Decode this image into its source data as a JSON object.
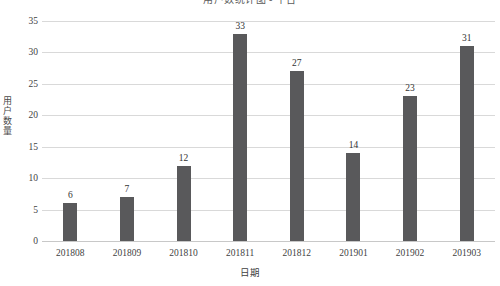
{
  "chart_data": {
    "type": "bar",
    "title": "用户数统计图 - 平台",
    "xlabel": "日期",
    "ylabel": "用户数量",
    "categories": [
      "201808",
      "201809",
      "201810",
      "201811",
      "201812",
      "201901",
      "201902",
      "201903"
    ],
    "values": [
      6,
      7,
      12,
      33,
      27,
      14,
      23,
      31
    ],
    "value_labels": [
      "6",
      "7",
      "12",
      "33",
      "27",
      "14",
      "23",
      "31"
    ],
    "ylim": [
      0,
      35
    ],
    "ytick_values": [
      0,
      5,
      10,
      15,
      20,
      25,
      30,
      35
    ],
    "ytick_labels": [
      "0",
      "5",
      "10",
      "15",
      "20",
      "25",
      "30",
      "35"
    ],
    "grid": true,
    "legend": false,
    "series": [
      {
        "name": "用户数量",
        "values": [
          6,
          7,
          12,
          33,
          27,
          14,
          23,
          31
        ]
      }
    ]
  },
  "style": {
    "bar_color": "#59595B",
    "grid_color": "#D9D9D9",
    "text_color": "#3F3F3F",
    "background": "#FFFFFF"
  }
}
